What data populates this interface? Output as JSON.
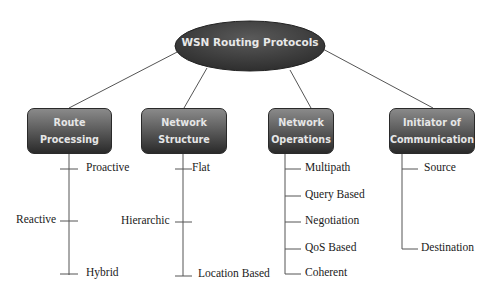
{
  "diagram": {
    "root": {
      "label": "WSN Routing Protocols"
    },
    "categories": [
      {
        "label": "Route Processing",
        "line1": "Route",
        "line2": "Processing",
        "children": [
          "Proactive",
          "Reactive",
          "Hybrid"
        ]
      },
      {
        "label": "Network Structure",
        "line1": "Network",
        "line2": "Structure",
        "children": [
          "Flat",
          "Hierarchic",
          "Location Based"
        ]
      },
      {
        "label": "Network Operations",
        "line1": "Network",
        "line2": "Operations",
        "children": [
          "Multipath",
          "Query Based",
          "Negotiation",
          "QoS Based",
          "Coherent"
        ]
      },
      {
        "label": "Initiator of Communication",
        "line1": "Initiator of",
        "line2": "Communication",
        "children": [
          "Source",
          "Destination"
        ]
      }
    ],
    "colors": {
      "node_dark": "#2a2a2a",
      "node_light": "#8a8a8a",
      "node_text": "#e6e6e6",
      "line": "#555555"
    }
  }
}
